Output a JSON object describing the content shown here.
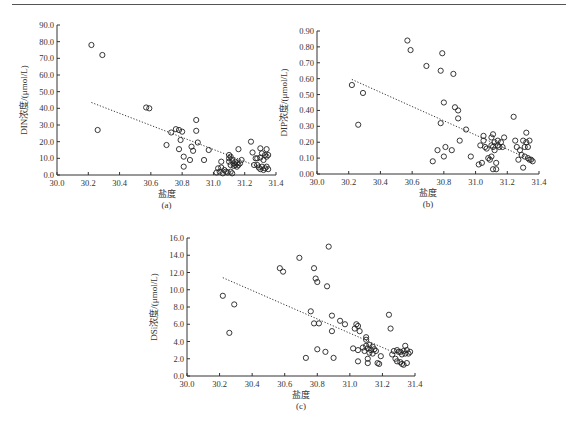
{
  "chart_data": [
    {
      "id": "a",
      "type": "scatter",
      "sublabel": "(a)",
      "xlabel": "盐度",
      "ylabel": "DIN浓度/(μmol/L)",
      "xlim": [
        30.0,
        31.4
      ],
      "ylim": [
        0,
        90
      ],
      "xticks": [
        30.0,
        30.2,
        30.4,
        30.6,
        30.8,
        31.0,
        31.2,
        31.4
      ],
      "yticks": [
        0,
        10,
        20,
        30,
        40,
        50,
        60,
        70,
        80,
        90
      ],
      "ytick_decimals": 1,
      "trendline": {
        "x": [
          30.22,
          31.3
        ],
        "y": [
          43.5,
          4.5
        ],
        "style": "dotted"
      },
      "grid": false,
      "legend": null,
      "points": [
        [
          30.22,
          78
        ],
        [
          30.29,
          72
        ],
        [
          30.26,
          27
        ],
        [
          30.57,
          40.5
        ],
        [
          30.59,
          40
        ],
        [
          30.7,
          18
        ],
        [
          30.73,
          25.5
        ],
        [
          30.76,
          27.5
        ],
        [
          30.78,
          27
        ],
        [
          30.8,
          26
        ],
        [
          30.78,
          15.5
        ],
        [
          30.79,
          21
        ],
        [
          30.81,
          11
        ],
        [
          30.81,
          5
        ],
        [
          30.85,
          9
        ],
        [
          30.86,
          17
        ],
        [
          30.87,
          14.5
        ],
        [
          30.89,
          33
        ],
        [
          30.89,
          26.5
        ],
        [
          30.9,
          19.5
        ],
        [
          30.94,
          9
        ],
        [
          30.97,
          15
        ],
        [
          31.02,
          1.5
        ],
        [
          31.03,
          4
        ],
        [
          31.04,
          2
        ],
        [
          31.05,
          8
        ],
        [
          31.05,
          4.5
        ],
        [
          31.06,
          1
        ],
        [
          31.07,
          3
        ],
        [
          31.08,
          2
        ],
        [
          31.09,
          1.5
        ],
        [
          31.1,
          12
        ],
        [
          31.1,
          10
        ],
        [
          31.1,
          8
        ],
        [
          31.11,
          11
        ],
        [
          31.11,
          6
        ],
        [
          31.11,
          2
        ],
        [
          31.12,
          9
        ],
        [
          31.12,
          1
        ],
        [
          31.13,
          7
        ],
        [
          31.13,
          5.5
        ],
        [
          31.14,
          8
        ],
        [
          31.14,
          6
        ],
        [
          31.15,
          7
        ],
        [
          31.15,
          5
        ],
        [
          31.16,
          15.5
        ],
        [
          31.16,
          6
        ],
        [
          31.17,
          7
        ],
        [
          31.18,
          9
        ],
        [
          31.24,
          20
        ],
        [
          31.25,
          13.5
        ],
        [
          31.26,
          6
        ],
        [
          31.27,
          10
        ],
        [
          31.28,
          6
        ],
        [
          31.28,
          10
        ],
        [
          31.29,
          4.5
        ],
        [
          31.3,
          16
        ],
        [
          31.3,
          10.5
        ],
        [
          31.3,
          3.5
        ],
        [
          31.31,
          13
        ],
        [
          31.31,
          5
        ],
        [
          31.32,
          9
        ],
        [
          31.32,
          3
        ],
        [
          31.33,
          12
        ],
        [
          31.33,
          4
        ],
        [
          31.34,
          15.5
        ],
        [
          31.34,
          11
        ],
        [
          31.34,
          5
        ],
        [
          31.35,
          12
        ],
        [
          31.35,
          3.5
        ]
      ]
    },
    {
      "id": "b",
      "type": "scatter",
      "sublabel": "(b)",
      "xlabel": "盐度",
      "ylabel": "DIP浓度/(μmol/L)",
      "xlim": [
        30.0,
        31.4
      ],
      "ylim": [
        0,
        0.9
      ],
      "xticks": [
        30.0,
        30.2,
        30.4,
        30.6,
        30.8,
        31.0,
        31.2,
        31.4
      ],
      "yticks": [
        0,
        0.1,
        0.2,
        0.3,
        0.4,
        0.5,
        0.6,
        0.7,
        0.8,
        0.9
      ],
      "ytick_decimals": 2,
      "trendline": {
        "x": [
          30.22,
          31.28
        ],
        "y": [
          0.595,
          0.12
        ],
        "style": "dotted"
      },
      "grid": false,
      "legend": null,
      "points": [
        [
          30.22,
          0.56
        ],
        [
          30.26,
          0.31
        ],
        [
          30.29,
          0.51
        ],
        [
          30.57,
          0.84
        ],
        [
          30.59,
          0.78
        ],
        [
          30.69,
          0.68
        ],
        [
          30.73,
          0.08
        ],
        [
          30.76,
          0.15
        ],
        [
          30.78,
          0.65
        ],
        [
          30.78,
          0.32
        ],
        [
          30.79,
          0.76
        ],
        [
          30.8,
          0.11
        ],
        [
          30.8,
          0.45
        ],
        [
          30.81,
          0.17
        ],
        [
          30.85,
          0.15
        ],
        [
          30.86,
          0.63
        ],
        [
          30.87,
          0.42
        ],
        [
          30.89,
          0.4
        ],
        [
          30.89,
          0.35
        ],
        [
          30.9,
          0.21
        ],
        [
          30.94,
          0.28
        ],
        [
          30.97,
          0.11
        ],
        [
          31.02,
          0.06
        ],
        [
          31.03,
          0.18
        ],
        [
          31.04,
          0.07
        ],
        [
          31.05,
          0.24
        ],
        [
          31.05,
          0.21
        ],
        [
          31.06,
          0.17
        ],
        [
          31.07,
          0.16
        ],
        [
          31.08,
          0.1
        ],
        [
          31.09,
          0.09
        ],
        [
          31.1,
          0.23
        ],
        [
          31.1,
          0.18
        ],
        [
          31.1,
          0.11
        ],
        [
          31.11,
          0.25
        ],
        [
          31.11,
          0.17
        ],
        [
          31.11,
          0.03
        ],
        [
          31.12,
          0.2
        ],
        [
          31.12,
          0.15
        ],
        [
          31.13,
          0.07
        ],
        [
          31.13,
          0.03
        ],
        [
          31.14,
          0.21
        ],
        [
          31.14,
          0.18
        ],
        [
          31.15,
          0.17
        ],
        [
          31.16,
          0.2
        ],
        [
          31.17,
          0.17
        ],
        [
          31.18,
          0.23
        ],
        [
          31.24,
          0.36
        ],
        [
          31.25,
          0.21
        ],
        [
          31.26,
          0.17
        ],
        [
          31.27,
          0.09
        ],
        [
          31.28,
          0.15
        ],
        [
          31.29,
          0.12
        ],
        [
          31.3,
          0.21
        ],
        [
          31.3,
          0.04
        ],
        [
          31.31,
          0.17
        ],
        [
          31.31,
          0.11
        ],
        [
          31.32,
          0.26
        ],
        [
          31.32,
          0.2
        ],
        [
          31.33,
          0.1
        ],
        [
          31.33,
          0.17
        ],
        [
          31.34,
          0.21
        ],
        [
          31.34,
          0.09
        ],
        [
          31.35,
          0.09
        ],
        [
          31.36,
          0.08
        ]
      ]
    },
    {
      "id": "c",
      "type": "scatter",
      "sublabel": "(c)",
      "xlabel": "盐度",
      "ylabel": "DSi浓度/(μmol/L)",
      "xlim": [
        30.0,
        31.4
      ],
      "ylim": [
        0,
        16
      ],
      "xticks": [
        30.0,
        30.2,
        30.4,
        30.6,
        30.8,
        31.0,
        31.2,
        31.4
      ],
      "yticks": [
        0,
        2,
        4,
        6,
        8,
        10,
        12,
        14,
        16
      ],
      "ytick_decimals": 1,
      "trendline": {
        "x": [
          30.22,
          31.25
        ],
        "y": [
          11.4,
          2.9
        ],
        "style": "dotted"
      },
      "grid": false,
      "legend": null,
      "points": [
        [
          30.22,
          9.3
        ],
        [
          30.26,
          5.0
        ],
        [
          30.29,
          8.3
        ],
        [
          30.57,
          12.5
        ],
        [
          30.59,
          12.1
        ],
        [
          30.69,
          13.7
        ],
        [
          30.73,
          2.1
        ],
        [
          30.76,
          7.5
        ],
        [
          30.78,
          12.5
        ],
        [
          30.78,
          6.1
        ],
        [
          30.79,
          11.3
        ],
        [
          30.8,
          10.9
        ],
        [
          30.8,
          3.1
        ],
        [
          30.81,
          6.1
        ],
        [
          30.85,
          2.8
        ],
        [
          30.86,
          10.4
        ],
        [
          30.87,
          15.0
        ],
        [
          30.89,
          7.0
        ],
        [
          30.89,
          5.2
        ],
        [
          30.9,
          2.1
        ],
        [
          30.94,
          6.4
        ],
        [
          30.97,
          6.0
        ],
        [
          31.02,
          3.2
        ],
        [
          31.03,
          5.5
        ],
        [
          31.04,
          6.0
        ],
        [
          31.05,
          5.8
        ],
        [
          31.05,
          3.0
        ],
        [
          31.05,
          1.7
        ],
        [
          31.06,
          5.2
        ],
        [
          31.08,
          3.3
        ],
        [
          31.09,
          2.9
        ],
        [
          31.1,
          4.5
        ],
        [
          31.1,
          4.2
        ],
        [
          31.1,
          3.5
        ],
        [
          31.11,
          3.2
        ],
        [
          31.11,
          2.0
        ],
        [
          31.11,
          1.5
        ],
        [
          31.12,
          3.6
        ],
        [
          31.12,
          2.7
        ],
        [
          31.13,
          3.0
        ],
        [
          31.14,
          3.4
        ],
        [
          31.14,
          2.6
        ],
        [
          31.15,
          3.1
        ],
        [
          31.16,
          2.9
        ],
        [
          31.17,
          1.5
        ],
        [
          31.18,
          1.4
        ],
        [
          31.19,
          2.3
        ],
        [
          31.24,
          7.1
        ],
        [
          31.25,
          5.5
        ],
        [
          31.26,
          2.5
        ],
        [
          31.27,
          2.9
        ],
        [
          31.28,
          2.0
        ],
        [
          31.29,
          3.0
        ],
        [
          31.29,
          1.7
        ],
        [
          31.3,
          2.8
        ],
        [
          31.31,
          1.6
        ],
        [
          31.31,
          2.8
        ],
        [
          31.32,
          1.4
        ],
        [
          31.32,
          2.5
        ],
        [
          31.33,
          2.9
        ],
        [
          31.33,
          1.3
        ],
        [
          31.34,
          3.5
        ],
        [
          31.34,
          2.6
        ],
        [
          31.35,
          3.0
        ],
        [
          31.35,
          1.5
        ],
        [
          31.36,
          2.6
        ],
        [
          31.37,
          2.8
        ]
      ]
    }
  ],
  "layout_colors": {
    "axis": "#333333",
    "marker_stroke": "#222222",
    "trendline": "#333333"
  }
}
